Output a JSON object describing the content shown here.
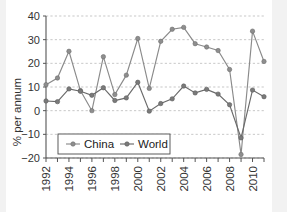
{
  "chart_data": {
    "type": "line",
    "title": "",
    "xlabel": "",
    "ylabel": "% per annum",
    "ylim": [
      -20,
      40
    ],
    "yticks": [
      -20,
      -10,
      0,
      10,
      20,
      30,
      40
    ],
    "ytick_labels": [
      "−20",
      "−10",
      "0",
      "10",
      "20",
      "30",
      "40"
    ],
    "grid": true,
    "legend_position": "lower-left-inside",
    "x": [
      1992,
      1993,
      1994,
      1995,
      1996,
      1997,
      1998,
      1999,
      2000,
      2001,
      2002,
      2003,
      2004,
      2005,
      2006,
      2007,
      2008,
      2009,
      2010,
      2011
    ],
    "xtick_labels": [
      "1992",
      "",
      "1994",
      "",
      "1996",
      "",
      "1998",
      "",
      "2000",
      "",
      "2002",
      "",
      "2004",
      "",
      "2006",
      "",
      "2008",
      "",
      "2010",
      ""
    ],
    "series": [
      {
        "name": "China",
        "marker": "circle",
        "color": "#8e8e8e",
        "values": [
          11.0,
          13.8,
          25.1,
          8.5,
          0.0,
          22.8,
          6.8,
          15.0,
          30.5,
          9.4,
          29.3,
          34.4,
          35.2,
          28.3,
          26.9,
          25.4,
          17.4,
          -18.5,
          33.6,
          20.8
        ]
      },
      {
        "name": "World",
        "marker": "circle",
        "color": "#7a7a7a",
        "values": [
          4.1,
          3.8,
          9.2,
          8.2,
          6.5,
          9.7,
          4.3,
          5.4,
          12.0,
          -0.2,
          3.0,
          5.0,
          10.4,
          7.5,
          9.0,
          7.0,
          2.5,
          -11.5,
          8.7,
          5.9
        ]
      }
    ]
  },
  "legend": {
    "items": [
      {
        "label": "China"
      },
      {
        "label": "World"
      }
    ]
  },
  "axis": {
    "y_title": "% per annum"
  }
}
